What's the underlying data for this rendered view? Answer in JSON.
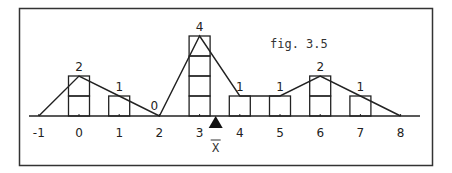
{
  "figure": {
    "caption": "fig. 3.5",
    "mean_label": "X",
    "mean_value": 3.4
  },
  "chart_data": {
    "type": "bar",
    "title": "fig. 3.5",
    "xlabel": "",
    "ylabel": "",
    "x_ticks": [
      "-1",
      "0",
      "1",
      "2",
      "3",
      "4",
      "5",
      "6",
      "7",
      "8"
    ],
    "categories": [
      "0",
      "1",
      "2",
      "3",
      "4",
      "5",
      "6",
      "7"
    ],
    "values": [
      2,
      1,
      0,
      4,
      1,
      1,
      2,
      1
    ],
    "data_labels": [
      "2",
      "1",
      "0",
      "4",
      "1",
      "1",
      "2",
      "1"
    ],
    "polygon_points": [
      [
        -1,
        0
      ],
      [
        0,
        2
      ],
      [
        1,
        1
      ],
      [
        2,
        0
      ],
      [
        3,
        4
      ],
      [
        4,
        1
      ],
      [
        5,
        1
      ],
      [
        6,
        2
      ],
      [
        7,
        1
      ],
      [
        8,
        0
      ]
    ],
    "mean_marker": {
      "x": 3.4,
      "label": "X̄"
    },
    "ylim": [
      0,
      4
    ],
    "grid": false,
    "legend": null
  }
}
